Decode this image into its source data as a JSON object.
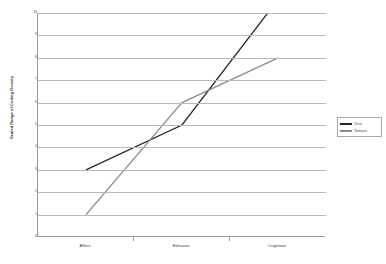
{
  "chart_data": {
    "type": "line",
    "title": "",
    "subtitle": "",
    "xlabel": "",
    "ylabel": "Scaled Range of Coding Density",
    "categories": [
      "Affect",
      "Behavior",
      "Cognition"
    ],
    "series": [
      {
        "name": "Tina",
        "values": [
          3,
          5,
          10.6
        ],
        "color": "#262626"
      },
      {
        "name": "Tamara",
        "values": [
          1,
          6,
          8
        ],
        "color": "#8c8c8c"
      }
    ],
    "ylim": [
      0,
      10
    ],
    "yticks": [
      0,
      1,
      2,
      3,
      4,
      5,
      6,
      7,
      8,
      9,
      10
    ],
    "ytick_labels": [
      "0",
      "1",
      "2",
      "3",
      "4",
      "5",
      "6",
      "7",
      "8",
      "9",
      "10"
    ],
    "grid": true,
    "legend_position": "right"
  },
  "legend": {
    "entries": [
      {
        "label": "Tina",
        "color": "#262626"
      },
      {
        "label": "Tamara",
        "color": "#8c8c8c"
      }
    ]
  },
  "axes": {
    "y_title": "Scaled Range of Coding Density"
  }
}
